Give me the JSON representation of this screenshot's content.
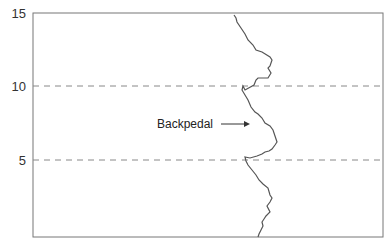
{
  "chart_data": {
    "type": "line",
    "title": "",
    "xlabel": "",
    "ylabel": "",
    "ylim": [
      0,
      15
    ],
    "yticks": [
      5,
      10,
      15
    ],
    "ytick_labels": [
      "5",
      "10",
      "15"
    ],
    "grid": {
      "horizontal_dashed_at": [
        5,
        10
      ]
    },
    "legend": null,
    "annotations": [
      {
        "text": "Backpedal",
        "arrow_to": "line",
        "y": 7.8
      }
    ],
    "series": [
      {
        "name": "trace",
        "orientation": "vertical (y is distance/time axis, x is lateral deviation)",
        "points_xy_px": [
          [
            234,
            15
          ],
          [
            236,
            18
          ],
          [
            237,
            22
          ],
          [
            241,
            28
          ],
          [
            245,
            34
          ],
          [
            248,
            40
          ],
          [
            253,
            45
          ],
          [
            256,
            50
          ],
          [
            262,
            52
          ],
          [
            270,
            57
          ],
          [
            272,
            60
          ],
          [
            270,
            66
          ],
          [
            268,
            68
          ],
          [
            271,
            73
          ],
          [
            268,
            78
          ],
          [
            258,
            78
          ],
          [
            256,
            80
          ],
          [
            254,
            85
          ],
          [
            245,
            90
          ],
          [
            243,
            86
          ],
          [
            242,
            90
          ],
          [
            245,
            95
          ],
          [
            248,
            100
          ],
          [
            251,
            107
          ],
          [
            255,
            112
          ],
          [
            258,
            114
          ],
          [
            262,
            118
          ],
          [
            265,
            123
          ],
          [
            270,
            126
          ],
          [
            273,
            130
          ],
          [
            275,
            136
          ],
          [
            277,
            142
          ],
          [
            275,
            145
          ],
          [
            272,
            149
          ],
          [
            269,
            151
          ],
          [
            265,
            152
          ],
          [
            262,
            154
          ],
          [
            257,
            156
          ],
          [
            250,
            158
          ],
          [
            245,
            157
          ],
          [
            246,
            161
          ],
          [
            248,
            165
          ],
          [
            252,
            170
          ],
          [
            256,
            175
          ],
          [
            259,
            180
          ],
          [
            263,
            184
          ],
          [
            268,
            188
          ],
          [
            270,
            195
          ],
          [
            272,
            198
          ],
          [
            270,
            202
          ],
          [
            267,
            206
          ],
          [
            270,
            212
          ],
          [
            266,
            216
          ],
          [
            264,
            219
          ],
          [
            262,
            222
          ],
          [
            263,
            226
          ],
          [
            261,
            230
          ],
          [
            259,
            234
          ],
          [
            258,
            237
          ]
        ]
      }
    ]
  },
  "labels": {
    "y15": "15",
    "y10": "10",
    "y5": "5",
    "annotation": "Backpedal"
  }
}
